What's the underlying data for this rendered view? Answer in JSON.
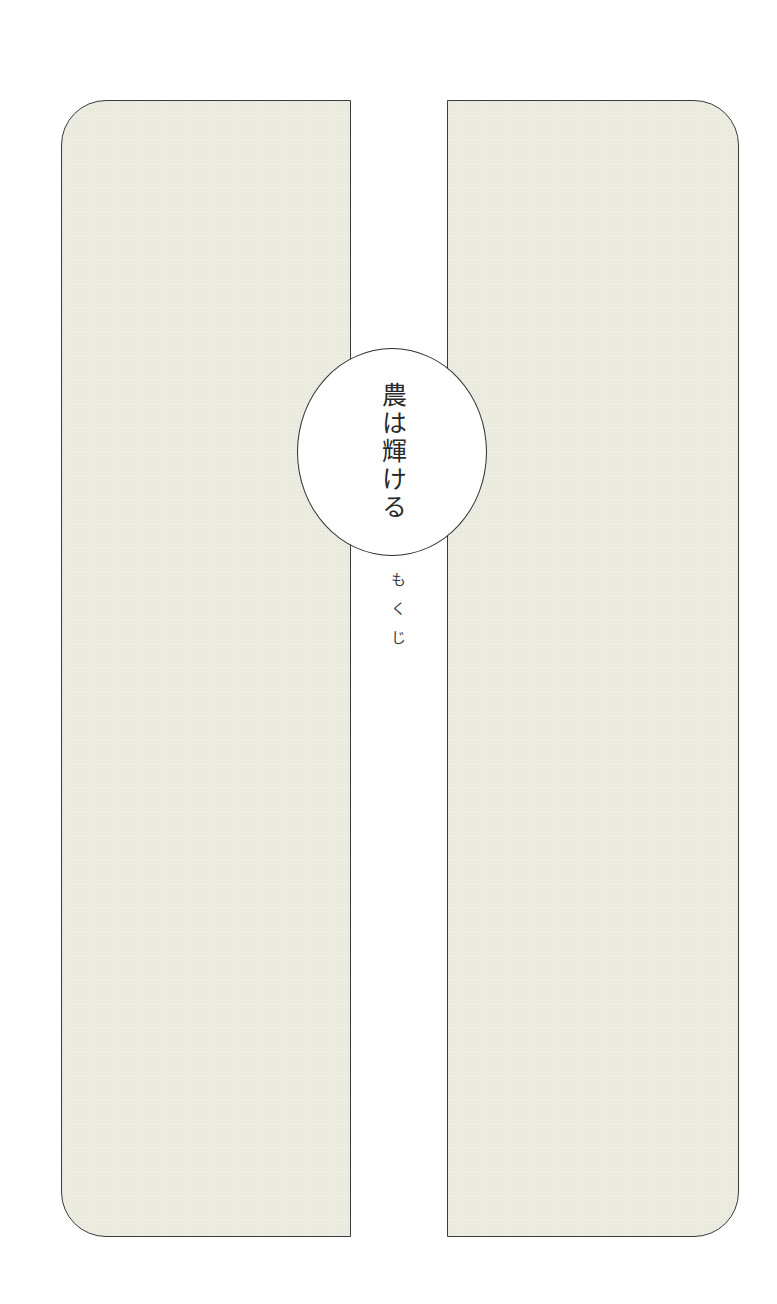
{
  "page": {
    "title": "農は輝ける",
    "subtitle": "もくじ"
  },
  "colors": {
    "panel_fill": "#ecebe0",
    "border": "#3a3a3a",
    "background": "#ffffff",
    "text": "#2a2a2a"
  }
}
